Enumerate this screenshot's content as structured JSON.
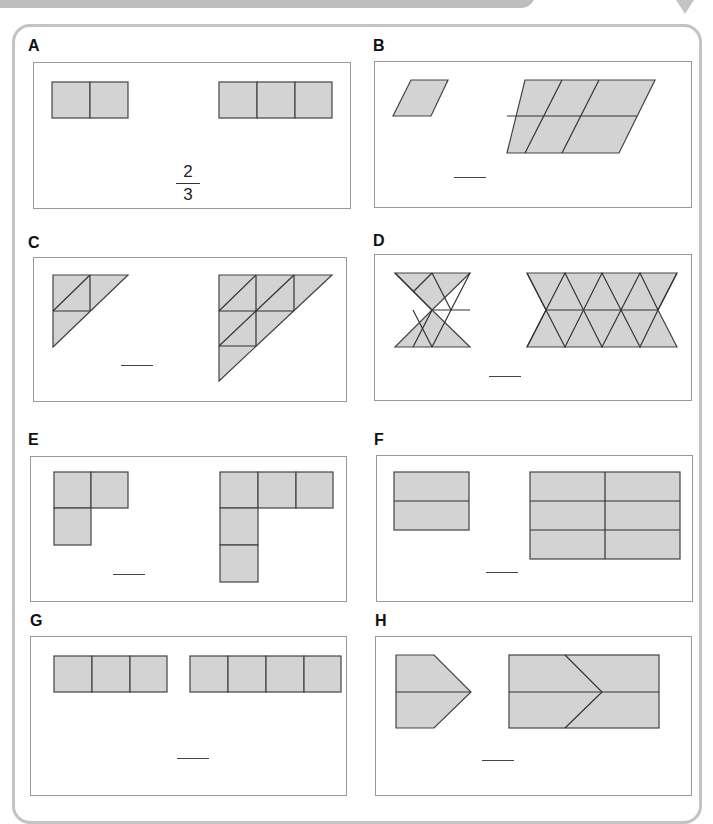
{
  "panels": [
    {
      "id": "A",
      "label": "A",
      "left_shape": "2 squares in a row",
      "right_shape": "3 squares in a row",
      "answer": {
        "numerator": "2",
        "denominator": "3"
      }
    },
    {
      "id": "B",
      "label": "B",
      "left_shape": "1 rhombus",
      "right_shape": "6 rhombuses (2 rows of 3)",
      "answer": "____"
    },
    {
      "id": "C",
      "label": "C",
      "left_shape": "right triangle of 4 small triangles",
      "right_shape": "right triangle of 9 small triangles",
      "answer": "____"
    },
    {
      "id": "D",
      "label": "D",
      "left_shape": "bow-tie of 6 triangles",
      "right_shape": "band of 14 triangles",
      "answer": "____"
    },
    {
      "id": "E",
      "label": "E",
      "left_shape": "L of 3 squares",
      "right_shape": "L of 5 squares",
      "answer": "____"
    },
    {
      "id": "F",
      "label": "F",
      "left_shape": "rectangle split in 2",
      "right_shape": "rectangle grid 2x3 (6 parts)",
      "answer": "____"
    },
    {
      "id": "G",
      "label": "G",
      "left_shape": "3 squares in a row",
      "right_shape": "4 squares in a row",
      "answer": "____"
    },
    {
      "id": "H",
      "label": "H",
      "left_shape": "pentagon arrow split in 2",
      "right_shape": "rectangle with arrow chevron split in 4",
      "answer": "____"
    }
  ],
  "colors": {
    "shape_fill": "#d3d3d3",
    "frame": "#c3c3c3",
    "panel_border": "#9a9a9a"
  }
}
